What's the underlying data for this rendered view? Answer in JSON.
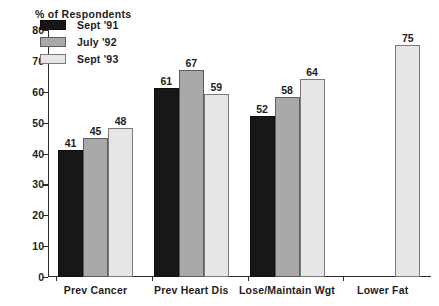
{
  "chart_data": {
    "type": "bar",
    "title": "% of Respondents",
    "xlabel": "",
    "ylabel": "",
    "ylim": [
      0,
      80
    ],
    "yticks": [
      0,
      10,
      20,
      30,
      40,
      50,
      60,
      70,
      80
    ],
    "ytick_labels": [
      "0",
      "10",
      "20",
      "30",
      "40",
      "50",
      "60",
      "70",
      "80"
    ],
    "grid": false,
    "legend_position": "upper-left-inside",
    "categories": [
      "Prev Cancer",
      "Prev Heart Dis",
      "Lose/Maintain Wgt",
      "Lower Fat"
    ],
    "series": [
      {
        "name": "Sept '91",
        "color": "#171717",
        "values": [
          41,
          61,
          52,
          null
        ],
        "value_labels": [
          "41",
          "61",
          "52",
          ""
        ]
      },
      {
        "name": "July '92",
        "color": "#a9a9a9",
        "values": [
          45,
          67,
          58,
          null
        ],
        "value_labels": [
          "45",
          "67",
          "58",
          ""
        ]
      },
      {
        "name": "Sept '93",
        "color": "#e6e6e6",
        "values": [
          48,
          59,
          64,
          75
        ],
        "value_labels": [
          "48",
          "59",
          "64",
          "75"
        ]
      }
    ]
  },
  "colors": {
    "series_0": "#171717",
    "series_1": "#a9a9a9",
    "series_2": "#e6e6e6",
    "axis": "#2b2b2b",
    "text": "#1d1d1d",
    "background": "#ffffff"
  }
}
